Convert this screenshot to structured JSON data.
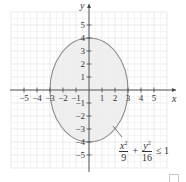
{
  "chart_data": {
    "type": "region",
    "title": "",
    "xlabel": "x",
    "ylabel": "y",
    "xlim": [
      -6,
      6
    ],
    "ylim": [
      -6,
      6
    ],
    "grid": true,
    "x_ticks": [
      -5,
      -4,
      -3,
      -2,
      -1,
      1,
      2,
      3,
      4,
      5
    ],
    "y_ticks": [
      -5,
      -4,
      -3,
      -2,
      -1,
      1,
      2,
      3,
      4,
      5
    ],
    "x_tick_labels": [
      "−5",
      "−4",
      "−3",
      "−2",
      "−1",
      "1",
      "2",
      "3",
      "4",
      "5"
    ],
    "y_tick_labels": [
      "−5",
      "−4",
      "−3",
      "−2",
      "−1",
      "1",
      "2",
      "3",
      "4",
      "5"
    ],
    "shape": {
      "kind": "ellipse",
      "center": [
        0,
        0
      ],
      "semi_axis_x": 3,
      "semi_axis_y": 4,
      "filled": true,
      "fill_color": "#ececec",
      "stroke_color": "#8a8a8a"
    },
    "annotation": {
      "text": "x^2/9 + y^2/16 ≤ 1",
      "pointer_from": [
        2.0,
        -2.5
      ],
      "pointer_to": [
        1.6,
        -2.1
      ]
    }
  },
  "labels": {
    "x_axis": "x",
    "y_axis": "y",
    "eq_num1": "x",
    "eq_den1": "9",
    "eq_plus": "+",
    "eq_num2": "y",
    "eq_den2": "16",
    "eq_rel": "≤ 1",
    "exp": "2"
  },
  "colors": {
    "axis": "#444444",
    "grid_major": "#dcdcdc",
    "grid_minor": "#efefef",
    "region_fill": "#ececec",
    "region_stroke": "#8a8a8a"
  }
}
